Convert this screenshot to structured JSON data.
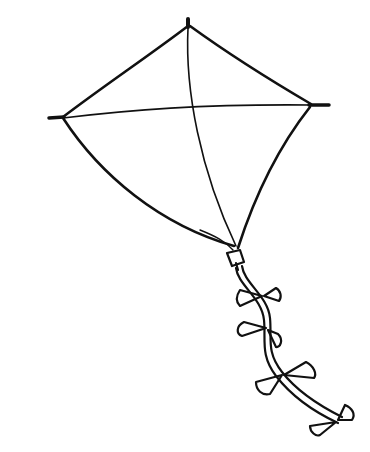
{
  "image": {
    "subject": "kite line drawing",
    "description": "Black-and-white outline drawing of a diamond kite with a cross spar and a wavy tail decorated with bow ties",
    "colors": {
      "background": "#ffffff",
      "ink": "#111111"
    },
    "parts": {
      "frame": "kite-frame",
      "spars": "cross-spars",
      "tail": "kite-tail",
      "bows": 4
    }
  }
}
